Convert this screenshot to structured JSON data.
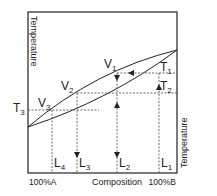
{
  "diagram": {
    "type": "binary-phase-diagram-distillation",
    "y_axis_left_label": "Temperature",
    "y_axis_right_label": "Temperature",
    "x_axis_label": "Composition",
    "x_left_label": "100%A",
    "x_right_label": "100%B",
    "temperatures": [
      {
        "label": "T",
        "sub": "1"
      },
      {
        "label": "T",
        "sub": "2"
      },
      {
        "label": "T",
        "sub": "3"
      }
    ],
    "vapour_points": [
      {
        "label": "V",
        "sub": "1"
      },
      {
        "label": "V",
        "sub": "2"
      },
      {
        "label": "V",
        "sub": "3"
      }
    ],
    "liquid_compositions": [
      {
        "label": "L",
        "sub": "1"
      },
      {
        "label": "L",
        "sub": "2"
      },
      {
        "label": "L",
        "sub": "3"
      },
      {
        "label": "L",
        "sub": "4"
      }
    ],
    "colors": {
      "line": "#222222",
      "background": "#ffffff"
    }
  }
}
